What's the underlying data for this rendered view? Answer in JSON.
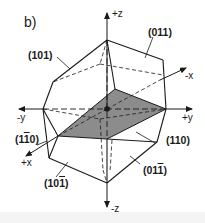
{
  "panel_label": "b)",
  "axes": {
    "plus_z": "+z",
    "minus_z": "-z",
    "plus_y": "+y",
    "minus_y": "-y",
    "plus_x": "+x",
    "minus_x": "-x"
  },
  "planes": {
    "p101": "(101)",
    "p011": "(011)",
    "p1m10_pre": "(1",
    "p1m10_bar": "1",
    "p1m10_post": "0)",
    "p110": "(110)",
    "p10m1_pre": "(10",
    "p10m1_bar": "1",
    "p10m1_post": ")",
    "p01m1_pre": "(01",
    "p01m1_bar": "1",
    "p01m1_post": ")"
  },
  "colors": {
    "line": "#1a1a1a",
    "shaded_plane": "#8c8c8c",
    "background": "#ffffff"
  }
}
